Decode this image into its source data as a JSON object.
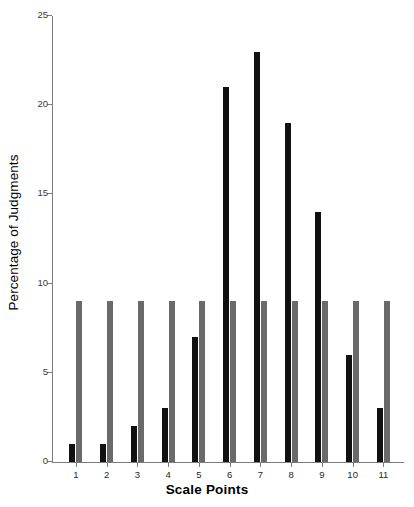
{
  "chart_data": {
    "type": "bar",
    "title": "",
    "subtitle": "",
    "xlabel": "Scale Points",
    "ylabel": "Percentage of Judgments",
    "categories": [
      "1",
      "2",
      "3",
      "4",
      "5",
      "6",
      "7",
      "8",
      "9",
      "10",
      "11"
    ],
    "series": [
      {
        "name": "Observed",
        "color": "#111111",
        "values": [
          1,
          1,
          2,
          3,
          7,
          21,
          23,
          19,
          14,
          6,
          3
        ]
      },
      {
        "name": "Uniform",
        "color": "#6a6a6a",
        "values": [
          9,
          9,
          9,
          9,
          9,
          9,
          9,
          9,
          9,
          9,
          9
        ]
      }
    ],
    "ylim": [
      0,
      25
    ],
    "yticks": [
      0,
      5,
      10,
      15,
      20,
      25
    ],
    "ytick_labels": [
      "0",
      "5",
      "10",
      "15",
      "20",
      "25"
    ],
    "xlim_categories": 11,
    "grid": false,
    "legend": "none",
    "annotations": []
  },
  "axes": {
    "y_title": "Percentage of Judgments",
    "x_title": "Scale Points"
  },
  "colors": {
    "observed_bar": "#111111",
    "uniform_bar": "#6a6a6a",
    "axis": "#7c7c7c",
    "background": "#ffffff",
    "tick_text": "#3b3b3b"
  }
}
